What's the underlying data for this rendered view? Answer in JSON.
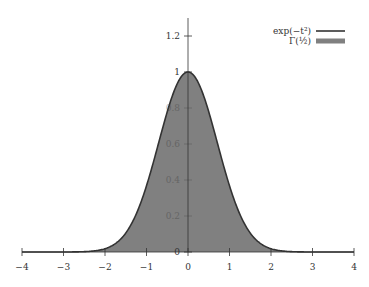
{
  "chart_data": {
    "type": "area",
    "title": "",
    "xlabel": "",
    "ylabel": "",
    "xlim": [
      -4,
      4
    ],
    "ylim": [
      0,
      1.3
    ],
    "grid": false,
    "legend_position": "top-right",
    "x_ticks": [
      "−4",
      "−3",
      "−2",
      "−1",
      "0",
      "1",
      "2",
      "3",
      "4"
    ],
    "x_tick_values": [
      -4,
      -3,
      -2,
      -1,
      0,
      1,
      2,
      3,
      4
    ],
    "y_ticks": [
      "0",
      "0.2",
      "0.4",
      "0.6",
      "0.8",
      "1",
      "1.2"
    ],
    "y_tick_values": [
      0,
      0.2,
      0.4,
      0.6,
      0.8,
      1,
      1.2
    ],
    "series": [
      {
        "name": "exp(−t²)",
        "kind": "line",
        "color": "#333333",
        "x": [
          -4,
          -3,
          -2,
          -1.5,
          -1,
          -0.5,
          0,
          0.5,
          1,
          1.5,
          2,
          3,
          4
        ],
        "values": [
          0.0,
          0.0001,
          0.018,
          0.105,
          0.368,
          0.779,
          1.0,
          0.779,
          0.368,
          0.105,
          0.018,
          0.0001,
          0.0
        ]
      },
      {
        "name": "Γ(½)",
        "kind": "area",
        "color": "#808080",
        "note": "area under exp(−t²) equals Γ(1/2) = √π"
      }
    ]
  },
  "legend": {
    "items": [
      {
        "label": "exp(−t²)",
        "style": "line"
      },
      {
        "label": "Γ(½)",
        "style": "fill"
      }
    ]
  }
}
